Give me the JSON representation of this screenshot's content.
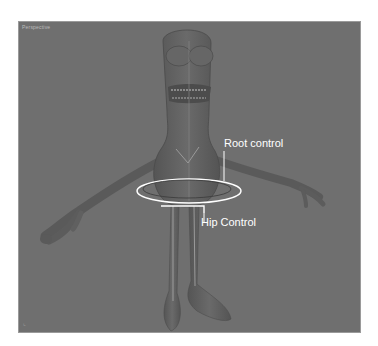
{
  "viewport": {
    "label": "Perspective",
    "background": "#6f6f6f"
  },
  "annotations": {
    "root_control": "Root control",
    "hip_control": "Hip Control"
  },
  "colors": {
    "control_curve": "#ffffff",
    "character": "#5e5e5e"
  }
}
